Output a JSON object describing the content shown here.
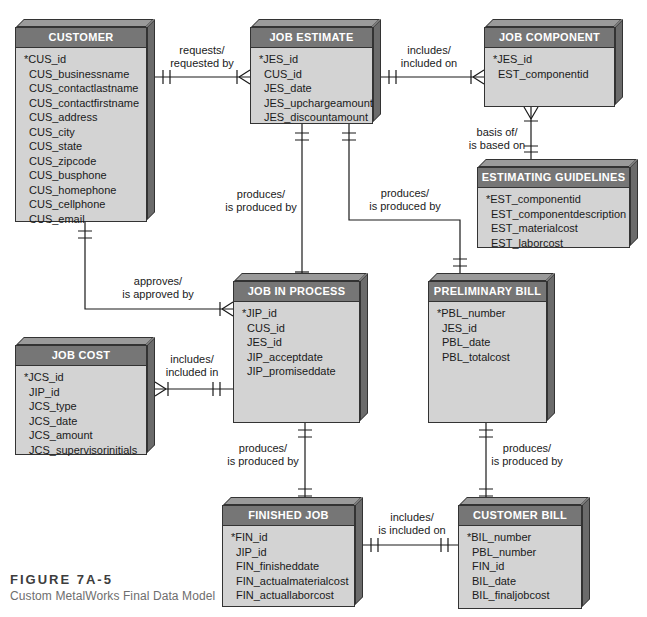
{
  "figure": {
    "number": "FIGURE 7A-5",
    "title": "Custom MetalWorks Final Data Model"
  },
  "entities": [
    {
      "id": "customer",
      "title": "CUSTOMER",
      "attributes": [
        "*CUS_id",
        "CUS_businessname",
        "CUS_contactlastname",
        "CUS_contactfirstname",
        "CUS_address",
        "CUS_city",
        "CUS_state",
        "CUS_zipcode",
        "CUS_busphone",
        "CUS_homephone",
        "CUS_cellphone",
        "CUS_email"
      ]
    },
    {
      "id": "job-estimate",
      "title": "JOB ESTIMATE",
      "attributes": [
        "*JES_id",
        "CUS_id",
        "JES_date",
        "JES_upchargeamount",
        "JES_discountamount"
      ]
    },
    {
      "id": "job-component",
      "title": "JOB COMPONENT",
      "attributes": [
        "*JES_id",
        "EST_componentid"
      ]
    },
    {
      "id": "estimating-guidelines",
      "title": "ESTIMATING GUIDELINES",
      "attributes": [
        "*EST_componentid",
        "EST_componentdescription",
        "EST_materialcost",
        "EST_laborcost"
      ]
    },
    {
      "id": "job-in-process",
      "title": "JOB IN PROCESS",
      "attributes": [
        "*JIP_id",
        "CUS_id",
        "JES_id",
        "JIP_acceptdate",
        "JIP_promiseddate"
      ]
    },
    {
      "id": "preliminary-bill",
      "title": "PRELIMINARY BILL",
      "attributes": [
        "*PBL_number",
        "JES_id",
        "PBL_date",
        "PBL_totalcost"
      ]
    },
    {
      "id": "job-cost",
      "title": "JOB COST",
      "attributes": [
        "*JCS_id",
        "JIP_id",
        "JCS_type",
        "JCS_date",
        "JCS_amount",
        "JCS_supervisorinitials"
      ]
    },
    {
      "id": "finished-job",
      "title": "FINISHED JOB",
      "attributes": [
        "*FIN_id",
        "JIP_id",
        "FIN_finisheddate",
        "FIN_actualmaterialcost",
        "FIN_actuallaborcost"
      ]
    },
    {
      "id": "customer-bill",
      "title": "CUSTOMER BILL",
      "attributes": [
        "*BIL_number",
        "PBL_number",
        "FIN_id",
        "BIL_date",
        "BIL_finaljobcost"
      ]
    }
  ],
  "relationships": [
    {
      "id": "customer-requests-job-estimate",
      "label": "requests/\nrequested by"
    },
    {
      "id": "job-estimate-includes-job-component",
      "label": "includes/\nincluded on"
    },
    {
      "id": "guidelines-basis-of-component",
      "label": "basis of/\nis based on"
    },
    {
      "id": "job-estimate-produces-job-in-process",
      "label": "produces/\nis produced by"
    },
    {
      "id": "job-estimate-produces-preliminary-bill",
      "label": "produces/\nis produced by"
    },
    {
      "id": "customer-approves-job-in-process",
      "label": "approves/\nis approved by"
    },
    {
      "id": "job-in-process-includes-job-cost",
      "label": "includes/\nincluded in"
    },
    {
      "id": "job-in-process-produces-finished-job",
      "label": "produces/\nis produced by"
    },
    {
      "id": "preliminary-bill-produces-customer-bill",
      "label": "produces/\nis produced by"
    },
    {
      "id": "finished-job-included-on-customer-bill",
      "label": "includes/\nis included on"
    }
  ],
  "colors": {
    "entity_header_fill": "#767676",
    "entity_body_fill": "#d3d3d3",
    "entity_depth_top": "#9a9a9a",
    "entity_depth_right": "#6b6b6b",
    "connector_color": "#1a1a1a",
    "background": "#ffffff"
  }
}
